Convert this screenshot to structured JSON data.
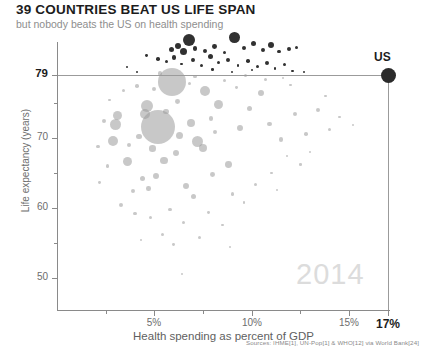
{
  "header": {
    "title": "39 COUNTRIES BEAT US LIFE SPAN",
    "subtitle": "but nobody beats the US on health spending"
  },
  "footer": {
    "sources": "Sources: IHME[1], UN-Pop[1] & WHO[12] via World Bank[24]"
  },
  "annotations": {
    "us_label": "US",
    "year_watermark": "2014"
  },
  "colors": {
    "title": "#1c1c1c",
    "subtitle": "#8e8e8e",
    "axis": "#8a8a8a",
    "bubble_below": "#9a9a9a",
    "bubble_above": "#1f1f1f",
    "us_marker": "#2b2b2b",
    "watermark": "#dcdcdc",
    "background": "#ffffff"
  },
  "chart_data": {
    "type": "scatter",
    "title": "39 COUNTRIES BEAT US LIFE SPAN",
    "subtitle": "but nobody beats the US on health spending",
    "xlabel": "Health spending as percent of GDP",
    "ylabel": "Life expectancy (years)",
    "xlim": [
      0,
      17.8
    ],
    "ylim": [
      45,
      86
    ],
    "grid": false,
    "legend": false,
    "bubble_size_meaning": "population",
    "x_ticks": [
      {
        "value": 5,
        "label": "5%",
        "major": true
      },
      {
        "value": 10,
        "label": "10%",
        "major": true
      },
      {
        "value": 15,
        "label": "15%",
        "major": true
      },
      {
        "value": 17,
        "label": "17%",
        "major": true,
        "highlight": true
      }
    ],
    "x_minor_ticks": [
      2.5,
      7.5,
      12.5
    ],
    "y_ticks": [
      {
        "value": 50,
        "label": "50",
        "major": true
      },
      {
        "value": 60,
        "label": "60",
        "major": true
      },
      {
        "value": 70,
        "label": "70",
        "major": true
      },
      {
        "value": 79,
        "label": "79",
        "major": true,
        "highlight": true
      }
    ],
    "y_minor_ticks": [
      55,
      65,
      75
    ],
    "reference_lines": [
      {
        "axis": "y",
        "value": 79,
        "label": "US life expectancy"
      },
      {
        "axis": "x",
        "value": 17,
        "label": "US health spending"
      }
    ],
    "highlight_point": {
      "label": "US",
      "x": 17,
      "y": 79,
      "size": 15
    },
    "series": [
      {
        "name": "Countries exceeding US life expectancy",
        "color": "#1f1f1f",
        "count": 39,
        "points": [
          {
            "x": 6.8,
            "y": 84.0,
            "r": 6.0
          },
          {
            "x": 6.2,
            "y": 83.2,
            "r": 3.0
          },
          {
            "x": 5.9,
            "y": 82.6,
            "r": 2.6
          },
          {
            "x": 6.5,
            "y": 82.3,
            "r": 3.6
          },
          {
            "x": 7.1,
            "y": 82.8,
            "r": 2.2
          },
          {
            "x": 7.6,
            "y": 82.5,
            "r": 2.0
          },
          {
            "x": 8.1,
            "y": 83.1,
            "r": 2.4
          },
          {
            "x": 8.6,
            "y": 82.2,
            "r": 1.8
          },
          {
            "x": 9.1,
            "y": 84.4,
            "r": 5.4
          },
          {
            "x": 9.6,
            "y": 82.9,
            "r": 2.2
          },
          {
            "x": 10.1,
            "y": 83.5,
            "r": 2.8
          },
          {
            "x": 10.6,
            "y": 82.6,
            "r": 2.0
          },
          {
            "x": 11.0,
            "y": 83.3,
            "r": 3.2
          },
          {
            "x": 11.4,
            "y": 82.4,
            "r": 1.7
          },
          {
            "x": 11.9,
            "y": 82.7,
            "r": 2.0
          },
          {
            "x": 12.3,
            "y": 83.0,
            "r": 1.5
          },
          {
            "x": 4.6,
            "y": 81.8,
            "r": 1.4
          },
          {
            "x": 5.2,
            "y": 81.3,
            "r": 1.8
          },
          {
            "x": 5.6,
            "y": 80.9,
            "r": 1.5
          },
          {
            "x": 6.0,
            "y": 81.5,
            "r": 2.2
          },
          {
            "x": 6.4,
            "y": 80.6,
            "r": 1.3
          },
          {
            "x": 7.0,
            "y": 81.1,
            "r": 1.9
          },
          {
            "x": 7.4,
            "y": 80.3,
            "r": 1.5
          },
          {
            "x": 7.9,
            "y": 81.6,
            "r": 2.6
          },
          {
            "x": 8.3,
            "y": 80.8,
            "r": 1.6
          },
          {
            "x": 8.8,
            "y": 81.2,
            "r": 2.0
          },
          {
            "x": 9.3,
            "y": 80.4,
            "r": 1.4
          },
          {
            "x": 9.8,
            "y": 81.0,
            "r": 1.8
          },
          {
            "x": 10.3,
            "y": 80.2,
            "r": 1.5
          },
          {
            "x": 10.8,
            "y": 80.7,
            "r": 2.1
          },
          {
            "x": 11.2,
            "y": 79.9,
            "r": 1.3
          },
          {
            "x": 11.7,
            "y": 80.5,
            "r": 1.7
          },
          {
            "x": 12.1,
            "y": 79.6,
            "r": 1.2
          },
          {
            "x": 3.6,
            "y": 80.1,
            "r": 1.2
          },
          {
            "x": 4.1,
            "y": 79.5,
            "r": 1.0
          },
          {
            "x": 8.0,
            "y": 79.8,
            "r": 1.3
          },
          {
            "x": 9.0,
            "y": 79.4,
            "r": 1.1
          },
          {
            "x": 10.0,
            "y": 79.7,
            "r": 1.2
          },
          {
            "x": 12.7,
            "y": 79.5,
            "r": 1.0
          }
        ]
      },
      {
        "name": "Countries at or below US life expectancy",
        "color": "#9a9a9a",
        "points": [
          {
            "x": 5.9,
            "y": 78.0,
            "r": 14.0
          },
          {
            "x": 5.2,
            "y": 71.6,
            "r": 17.0
          },
          {
            "x": 4.6,
            "y": 74.6,
            "r": 6.0
          },
          {
            "x": 4.5,
            "y": 73.5,
            "r": 5.0
          },
          {
            "x": 3.1,
            "y": 73.2,
            "r": 4.5
          },
          {
            "x": 3.0,
            "y": 71.9,
            "r": 5.5
          },
          {
            "x": 2.9,
            "y": 69.6,
            "r": 5.0
          },
          {
            "x": 3.6,
            "y": 66.6,
            "r": 4.5
          },
          {
            "x": 7.6,
            "y": 76.7,
            "r": 5.0
          },
          {
            "x": 8.3,
            "y": 74.8,
            "r": 4.5
          },
          {
            "x": 6.9,
            "y": 72.2,
            "r": 4.0
          },
          {
            "x": 7.2,
            "y": 69.5,
            "r": 5.5
          },
          {
            "x": 7.5,
            "y": 68.6,
            "r": 4.0
          },
          {
            "x": 6.3,
            "y": 70.4,
            "r": 3.5
          },
          {
            "x": 6.1,
            "y": 67.8,
            "r": 3.0
          },
          {
            "x": 4.9,
            "y": 68.5,
            "r": 3.2
          },
          {
            "x": 4.2,
            "y": 70.2,
            "r": 2.8
          },
          {
            "x": 5.5,
            "y": 66.8,
            "r": 3.8
          },
          {
            "x": 5.1,
            "y": 64.6,
            "r": 3.0
          },
          {
            "x": 4.4,
            "y": 64.2,
            "r": 2.5
          },
          {
            "x": 3.9,
            "y": 62.4,
            "r": 2.2
          },
          {
            "x": 6.6,
            "y": 63.2,
            "r": 3.0
          },
          {
            "x": 7.0,
            "y": 61.6,
            "r": 2.6
          },
          {
            "x": 8.0,
            "y": 64.8,
            "r": 2.4
          },
          {
            "x": 8.8,
            "y": 66.2,
            "r": 3.4
          },
          {
            "x": 9.4,
            "y": 71.4,
            "r": 3.2
          },
          {
            "x": 9.9,
            "y": 74.2,
            "r": 2.6
          },
          {
            "x": 10.5,
            "y": 76.5,
            "r": 3.0
          },
          {
            "x": 10.9,
            "y": 72.0,
            "r": 2.4
          },
          {
            "x": 11.5,
            "y": 69.8,
            "r": 2.2
          },
          {
            "x": 12.2,
            "y": 73.5,
            "r": 2.0
          },
          {
            "x": 12.8,
            "y": 70.6,
            "r": 1.8
          },
          {
            "x": 13.4,
            "y": 74.0,
            "r": 2.0
          },
          {
            "x": 14.0,
            "y": 71.2,
            "r": 1.6
          },
          {
            "x": 2.4,
            "y": 72.4,
            "r": 2.0
          },
          {
            "x": 2.1,
            "y": 68.8,
            "r": 1.8
          },
          {
            "x": 2.6,
            "y": 66.0,
            "r": 1.6
          },
          {
            "x": 3.3,
            "y": 60.4,
            "r": 2.0
          },
          {
            "x": 4.0,
            "y": 59.2,
            "r": 1.8
          },
          {
            "x": 4.8,
            "y": 58.6,
            "r": 1.6
          },
          {
            "x": 5.8,
            "y": 59.8,
            "r": 1.7
          },
          {
            "x": 6.5,
            "y": 58.0,
            "r": 1.5
          },
          {
            "x": 7.8,
            "y": 59.4,
            "r": 1.4
          },
          {
            "x": 8.5,
            "y": 57.6,
            "r": 1.3
          },
          {
            "x": 5.4,
            "y": 56.2,
            "r": 1.6
          },
          {
            "x": 6.0,
            "y": 54.8,
            "r": 1.4
          },
          {
            "x": 4.3,
            "y": 55.4,
            "r": 1.2
          },
          {
            "x": 9.0,
            "y": 62.0,
            "r": 1.6
          },
          {
            "x": 9.6,
            "y": 60.8,
            "r": 1.3
          },
          {
            "x": 10.2,
            "y": 63.4,
            "r": 1.5
          },
          {
            "x": 11.0,
            "y": 65.0,
            "r": 1.4
          },
          {
            "x": 11.8,
            "y": 67.4,
            "r": 1.2
          },
          {
            "x": 12.5,
            "y": 66.2,
            "r": 1.3
          },
          {
            "x": 13.0,
            "y": 68.0,
            "r": 1.1
          },
          {
            "x": 3.4,
            "y": 76.8,
            "r": 1.6
          },
          {
            "x": 2.7,
            "y": 75.4,
            "r": 1.3
          },
          {
            "x": 4.1,
            "y": 77.4,
            "r": 1.8
          },
          {
            "x": 5.0,
            "y": 77.0,
            "r": 2.0
          },
          {
            "x": 6.8,
            "y": 77.8,
            "r": 1.7
          },
          {
            "x": 8.6,
            "y": 78.2,
            "r": 1.5
          },
          {
            "x": 9.2,
            "y": 77.2,
            "r": 1.4
          },
          {
            "x": 10.7,
            "y": 78.4,
            "r": 1.6
          },
          {
            "x": 12.0,
            "y": 77.6,
            "r": 1.2
          },
          {
            "x": 13.8,
            "y": 76.0,
            "r": 1.3
          },
          {
            "x": 6.2,
            "y": 75.2,
            "r": 2.4
          },
          {
            "x": 5.6,
            "y": 73.8,
            "r": 2.8
          },
          {
            "x": 7.9,
            "y": 72.8,
            "r": 2.2
          },
          {
            "x": 8.1,
            "y": 70.8,
            "r": 2.0
          },
          {
            "x": 4.7,
            "y": 62.8,
            "r": 2.2
          },
          {
            "x": 3.7,
            "y": 69.0,
            "r": 2.4
          },
          {
            "x": 2.2,
            "y": 63.6,
            "r": 1.4
          },
          {
            "x": 7.3,
            "y": 55.8,
            "r": 1.5
          },
          {
            "x": 8.9,
            "y": 54.4,
            "r": 1.2
          },
          {
            "x": 6.4,
            "y": 50.6,
            "r": 1.1
          },
          {
            "x": 11.3,
            "y": 62.6,
            "r": 1.1
          },
          {
            "x": 14.5,
            "y": 73.0,
            "r": 1.2
          },
          {
            "x": 15.2,
            "y": 71.8,
            "r": 1.0
          },
          {
            "x": 5.3,
            "y": 79.2,
            "r": 2.2
          },
          {
            "x": 7.1,
            "y": 78.8,
            "r": 1.8
          },
          {
            "x": 9.7,
            "y": 79.0,
            "r": 1.5
          },
          {
            "x": 11.6,
            "y": 78.6,
            "r": 1.3
          }
        ]
      }
    ]
  }
}
